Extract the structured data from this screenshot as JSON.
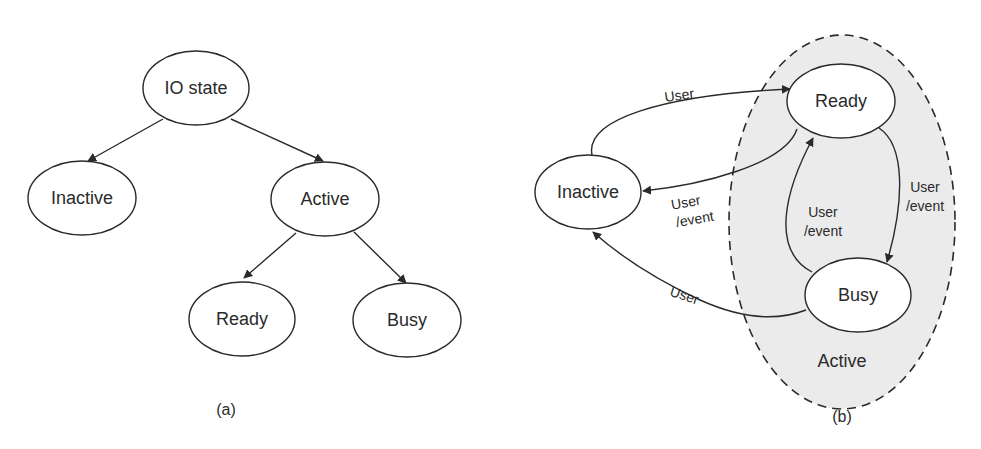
{
  "figure_a": {
    "caption": "(a)",
    "nodes": {
      "io_state": "IO state",
      "inactive": "Inactive",
      "active": "Active",
      "ready": "Ready",
      "busy": "Busy"
    },
    "edges": [
      {
        "from": "IO state",
        "to": "Inactive"
      },
      {
        "from": "IO state",
        "to": "Active"
      },
      {
        "from": "Active",
        "to": "Ready"
      },
      {
        "from": "Active",
        "to": "Busy"
      }
    ]
  },
  "figure_b": {
    "caption": "(b)",
    "group_label": "Active",
    "nodes": {
      "inactive": "Inactive",
      "ready": "Ready",
      "busy": "Busy"
    },
    "edge_labels": {
      "inactive_to_ready": "User",
      "ready_to_inactive_line1": "User",
      "ready_to_inactive_line2": "/event",
      "busy_to_inactive": "User",
      "busy_to_ready_line1": "User",
      "busy_to_ready_line2": "/event",
      "ready_to_busy_line1": "User",
      "ready_to_busy_line2": "/event"
    },
    "edges": [
      {
        "from": "Inactive",
        "to": "Ready",
        "label": "User"
      },
      {
        "from": "Ready",
        "to": "Inactive",
        "label": "User /event"
      },
      {
        "from": "Busy",
        "to": "Inactive",
        "label": "User"
      },
      {
        "from": "Busy",
        "to": "Ready",
        "label": "User /event"
      },
      {
        "from": "Ready",
        "to": "Busy",
        "label": "User /event"
      }
    ]
  }
}
